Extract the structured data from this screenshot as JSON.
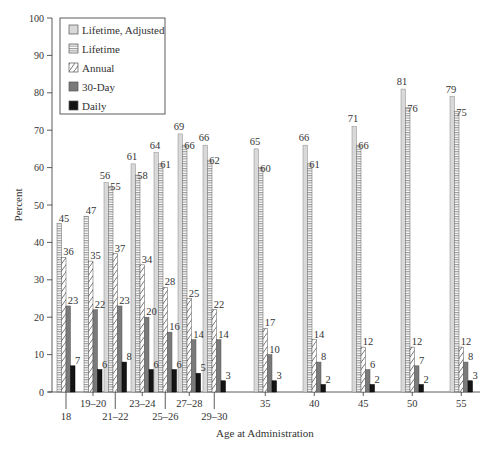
{
  "chart_data": {
    "type": "bar",
    "title": "",
    "xlabel": "Age at Administration",
    "ylabel": "Percent",
    "ylim": [
      0,
      100
    ],
    "yticks": [
      0,
      10,
      20,
      30,
      40,
      50,
      60,
      70,
      80,
      90,
      100
    ],
    "grid": false,
    "legend_position": "top-left",
    "categories": [
      "18",
      "19–20",
      "21–22",
      "23–24",
      "25–26",
      "27–28",
      "29–30",
      "35",
      "40",
      "45",
      "50",
      "55"
    ],
    "series": [
      {
        "name": "Lifetime, Adjusted",
        "pattern": "light-gray",
        "values": [
          null,
          null,
          56,
          61,
          64,
          69,
          66,
          65,
          66,
          71,
          81,
          79
        ]
      },
      {
        "name": "Lifetime",
        "pattern": "horizontal-lines",
        "values": [
          45,
          47,
          55,
          58,
          61,
          66,
          62,
          60,
          61,
          66,
          76,
          75
        ]
      },
      {
        "name": "Annual",
        "pattern": "diagonal-lines",
        "values": [
          36,
          35,
          37,
          34,
          28,
          25,
          22,
          17,
          14,
          12,
          12,
          12
        ]
      },
      {
        "name": "30-Day",
        "pattern": "dark-gray",
        "values": [
          23,
          22,
          23,
          20,
          16,
          14,
          14,
          10,
          8,
          6,
          7,
          8
        ]
      },
      {
        "name": "Daily",
        "pattern": "black",
        "values": [
          7,
          6,
          8,
          6,
          6,
          5,
          3,
          3,
          2,
          2,
          2,
          3
        ]
      }
    ]
  },
  "colors": {
    "axis": "#333333",
    "adjusted_fill": "#d9d9d9",
    "lifetime_stroke": "#666666",
    "annual_stroke": "#555555",
    "thirty_day_fill": "#7a7a7a",
    "daily_fill": "#141414"
  }
}
